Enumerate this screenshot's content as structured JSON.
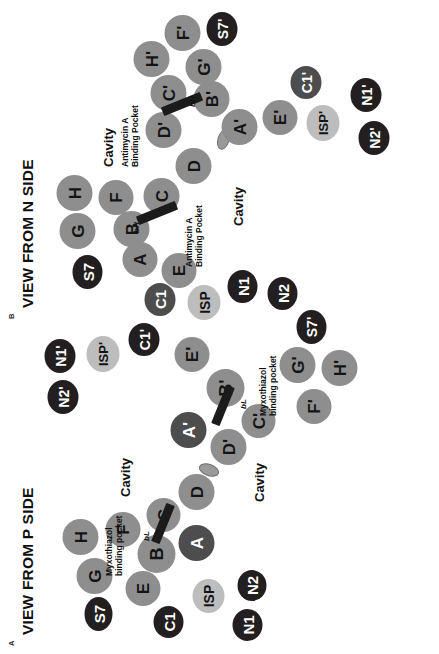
{
  "figure": {
    "panels": [
      {
        "id": "A",
        "letter": "A",
        "title": "VIEW FROM P SIDE",
        "inhibitor": "Myxothiazol",
        "helix_label": "bL",
        "cavity_label": "Cavity",
        "pocket_line1": "Myxothiazol",
        "pocket_line2": "binding pocket",
        "nodes": [
          {
            "label": "S7",
            "shade": "dark"
          },
          {
            "label": "G",
            "shade": "grey"
          },
          {
            "label": "H",
            "shade": "grey"
          },
          {
            "label": "F",
            "shade": "grey"
          },
          {
            "label": "C1",
            "shade": "dark"
          },
          {
            "label": "E",
            "shade": "grey"
          },
          {
            "label": "B",
            "shade": "grey"
          },
          {
            "label": "C",
            "shade": "grey"
          },
          {
            "label": "A",
            "shade": "mid"
          },
          {
            "label": "D",
            "shade": "grey"
          },
          {
            "label": "ISP",
            "shade": "light"
          },
          {
            "label": "N1",
            "shade": "dark"
          },
          {
            "label": "N2",
            "shade": "dark"
          },
          {
            "label": "D'",
            "shade": "grey"
          },
          {
            "label": "A'",
            "shade": "mid"
          },
          {
            "label": "C'",
            "shade": "grey"
          },
          {
            "label": "B'",
            "shade": "grey"
          },
          {
            "label": "E'",
            "shade": "grey"
          },
          {
            "label": "F'",
            "shade": "grey"
          },
          {
            "label": "G'",
            "shade": "grey"
          },
          {
            "label": "H'",
            "shade": "grey"
          },
          {
            "label": "S7'",
            "shade": "dark"
          },
          {
            "label": "C1'",
            "shade": "dark"
          },
          {
            "label": "ISP'",
            "shade": "light"
          },
          {
            "label": "N1'",
            "shade": "dark"
          },
          {
            "label": "N2'",
            "shade": "dark"
          }
        ]
      },
      {
        "id": "B",
        "letter": "B",
        "title": "VIEW FROM N SIDE",
        "inhibitor": "Antimycin A",
        "helix_label": "bH",
        "cavity_label": "Cavity",
        "pocket_line1": "Antimycin A",
        "pocket_line2": "Binding Pocket",
        "nodes": [
          {
            "label": "S7",
            "shade": "dark"
          },
          {
            "label": "G",
            "shade": "grey"
          },
          {
            "label": "H",
            "shade": "grey"
          },
          {
            "label": "F",
            "shade": "grey"
          },
          {
            "label": "B",
            "shade": "grey"
          },
          {
            "label": "A",
            "shade": "grey"
          },
          {
            "label": "C",
            "shade": "grey"
          },
          {
            "label": "D",
            "shade": "grey"
          },
          {
            "label": "E",
            "shade": "grey"
          },
          {
            "label": "C1",
            "shade": "mid"
          },
          {
            "label": "ISP",
            "shade": "light"
          },
          {
            "label": "N1",
            "shade": "dark"
          },
          {
            "label": "N2",
            "shade": "dark"
          },
          {
            "label": "D'",
            "shade": "grey"
          },
          {
            "label": "C'",
            "shade": "grey"
          },
          {
            "label": "H'",
            "shade": "grey"
          },
          {
            "label": "F'",
            "shade": "grey"
          },
          {
            "label": "G'",
            "shade": "grey"
          },
          {
            "label": "B'",
            "shade": "grey"
          },
          {
            "label": "A'",
            "shade": "grey"
          },
          {
            "label": "E'",
            "shade": "grey"
          },
          {
            "label": "S7'",
            "shade": "dark"
          },
          {
            "label": "C1'",
            "shade": "mid"
          },
          {
            "label": "ISP'",
            "shade": "light"
          },
          {
            "label": "N1'",
            "shade": "dark"
          },
          {
            "label": "N2'",
            "shade": "dark"
          }
        ]
      }
    ]
  }
}
